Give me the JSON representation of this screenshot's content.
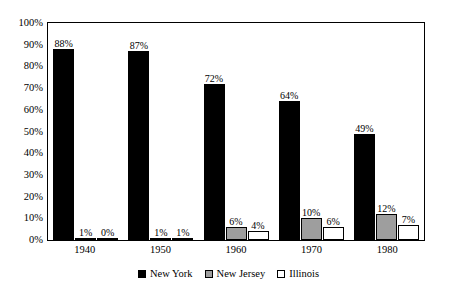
{
  "chart_data": {
    "type": "bar",
    "title": "",
    "subtitle": "",
    "xlabel": "",
    "ylabel": "",
    "categories": [
      "1940",
      "1950",
      "1960",
      "1970",
      "1980"
    ],
    "series": [
      {
        "name": "New York",
        "color": "#000000",
        "values": [
          88,
          87,
          72,
          64,
          49
        ],
        "labels": [
          "88%",
          "87%",
          "72%",
          "64%",
          "49%"
        ]
      },
      {
        "name": "New Jersey",
        "color": "#9e9e9e",
        "values": [
          1,
          1,
          6,
          10,
          12
        ],
        "labels": [
          "1%",
          "1%",
          "6%",
          "10%",
          "12%"
        ]
      },
      {
        "name": "Illinois",
        "color": "#ffffff",
        "values": [
          0,
          1,
          4,
          6,
          7
        ],
        "labels": [
          "0%",
          "1%",
          "4%",
          "6%",
          "7%"
        ]
      }
    ],
    "ylim": [
      0,
      100
    ],
    "ytick_labels": [
      "0%",
      "10%",
      "20%",
      "30%",
      "40%",
      "50%",
      "60%",
      "70%",
      "80%",
      "90%",
      "100%"
    ],
    "ytick_values": [
      0,
      10,
      20,
      30,
      40,
      50,
      60,
      70,
      80,
      90,
      100
    ],
    "grid": false,
    "legend_position": "bottom-center",
    "frame": true,
    "value_labels": true
  },
  "legend": {
    "entries": [
      {
        "label": "New York",
        "swatch": "filled-black-square-icon"
      },
      {
        "label": "New Jersey",
        "swatch": "filled-gray-square-icon"
      },
      {
        "label": "Illinois",
        "swatch": "outlined-white-square-icon"
      }
    ]
  },
  "colors": {
    "series_new_york": "#000000",
    "series_new_jersey": "#9e9e9e",
    "series_illinois": "#ffffff",
    "axis": "#000000",
    "background": "#ffffff"
  }
}
